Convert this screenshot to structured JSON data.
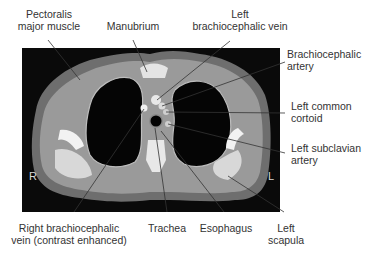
{
  "figure": {
    "type": "axial CT scan of upper thorax",
    "orientation": {
      "right_marker": "R",
      "left_marker": "L"
    }
  },
  "labels": {
    "pectoralis": {
      "line1": "Pectoralis",
      "line2": "major muscle"
    },
    "manubrium": {
      "line1": "Manubrium"
    },
    "left_brachiocephalic_vein": {
      "line1": "Left",
      "line2": "brachiocephalic vein"
    },
    "brachiocephalic_artery": {
      "line1": "Brachiocephalic",
      "line2": "artery"
    },
    "left_common_carotid": {
      "line1": "Left common",
      "line2": "cortoid"
    },
    "left_subclavian": {
      "line1": "Left subclavian",
      "line2": "artery"
    },
    "right_brachiocephalic_vein": {
      "line1": "Right brachiocephalic",
      "line2": "vein (contrast enhanced)"
    },
    "trachea": {
      "line1": "Trachea"
    },
    "esophagus": {
      "line1": "Esophagus"
    },
    "left_scapula": {
      "line1": "Left",
      "line2": "scapula"
    }
  },
  "colors": {
    "background": "#ffffff",
    "ct_background": "#0a0a0a",
    "label_text": "#333333",
    "leader_line": "#333333"
  }
}
